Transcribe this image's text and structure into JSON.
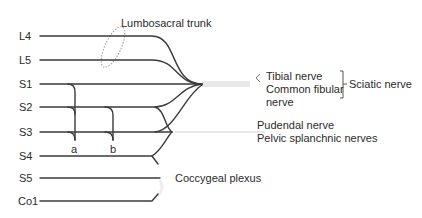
{
  "diagram": {
    "type": "sacral-plexus-schematic",
    "roots": [
      {
        "label": "L4",
        "y": 36
      },
      {
        "label": "L5",
        "y": 60
      },
      {
        "label": "S1",
        "y": 84
      },
      {
        "label": "S2",
        "y": 107
      },
      {
        "label": "S3",
        "y": 132
      },
      {
        "label": "S4",
        "y": 156
      },
      {
        "label": "S5",
        "y": 178
      },
      {
        "label": "Co1",
        "y": 201
      }
    ],
    "annotations": {
      "lumbosacral_trunk": "Lumbosacral trunk",
      "tibial": "Tibial nerve",
      "common_fibular_1": "Common fibular",
      "common_fibular_2": "nerve",
      "sciatic": "Sciatic nerve",
      "pudendal": "Pudendal nerve",
      "pelvic_splanchnic": "Pelvic splanchnic nerves",
      "coccygeal": "Coccygeal plexus",
      "branch_a": "a",
      "branch_b": "b"
    },
    "colors": {
      "line": "#3a3a3a",
      "trunk_band": "#e6e6e6",
      "ellipse": "#9a9a9a"
    }
  }
}
